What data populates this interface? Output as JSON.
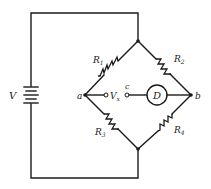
{
  "diagram": {
    "type": "circuit",
    "source": {
      "label": "V",
      "type": "battery"
    },
    "nodes": {
      "a": "a",
      "b": "b",
      "c": "c"
    },
    "resistors": [
      {
        "id": "R1",
        "label": "R",
        "subscript": "1",
        "between": [
          "top",
          "a"
        ]
      },
      {
        "id": "R2",
        "label": "R",
        "subscript": "2",
        "between": [
          "top",
          "b"
        ]
      },
      {
        "id": "R3",
        "label": "R",
        "subscript": "3",
        "between": [
          "a",
          "bottom"
        ]
      },
      {
        "id": "R4",
        "label": "R",
        "subscript": "4",
        "between": [
          "b",
          "bottom"
        ]
      }
    ],
    "unknown_voltage": {
      "label": "V",
      "subscript": "x"
    },
    "detector": {
      "label": "D"
    }
  }
}
